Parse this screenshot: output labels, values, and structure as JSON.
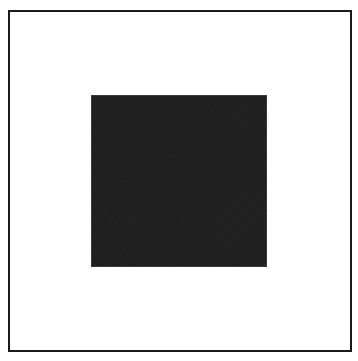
{
  "diagram": {
    "shapes": [
      {
        "id": "outer-frame",
        "type": "square-outline",
        "stroke_color": "#1a1a1a",
        "fill_color": "#ffffff"
      },
      {
        "id": "inner-square",
        "type": "filled-square",
        "fill_color": "#1f1f1f"
      }
    ]
  }
}
